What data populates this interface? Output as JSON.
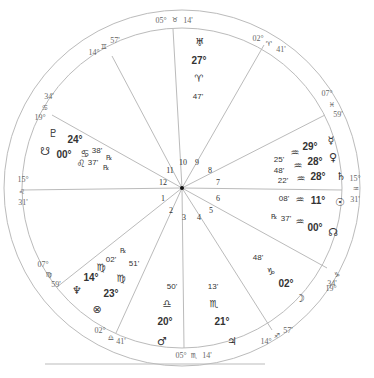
{
  "chart": {
    "center": [
      182,
      188
    ],
    "outer_radius": 178,
    "inner_radius": 160,
    "line_color": "#bbbbbb",
    "bottom_rule": {
      "x1": 45,
      "x2": 265,
      "y": 364
    }
  },
  "house_cusp_lines": [
    {
      "name": "cusp-line-10",
      "x": 173,
      "y": 29
    },
    {
      "name": "cusp-line-9",
      "x": 264,
      "y": 45
    },
    {
      "name": "cusp-line-8",
      "x": 325,
      "y": 115
    },
    {
      "name": "cusp-line-7",
      "x": 342,
      "y": 190
    },
    {
      "name": "cusp-line-6",
      "x": 327,
      "y": 268
    },
    {
      "name": "cusp-line-5",
      "x": 272,
      "y": 330
    },
    {
      "name": "cusp-line-4",
      "x": 184,
      "y": 348
    },
    {
      "name": "cusp-line-3",
      "x": 116,
      "y": 333
    },
    {
      "name": "cusp-line-2",
      "x": 57,
      "y": 287
    },
    {
      "name": "cusp-line-1",
      "x": 22,
      "y": 190
    },
    {
      "name": "cusp-line-12",
      "x": 52,
      "y": 115
    },
    {
      "name": "cusp-line-11",
      "x": 112,
      "y": 56
    }
  ],
  "house_cusps": [
    {
      "house": 10,
      "degree": "05°",
      "sign": "♉",
      "sign_name": "taurus",
      "minute": "14'"
    },
    {
      "house": 11,
      "degree": "14°",
      "sign": "♊",
      "sign_name": "gemini",
      "minute": "57'"
    },
    {
      "house": 12,
      "degree": "19°",
      "sign": "♋",
      "sign_name": "cancer",
      "minute": "34'"
    },
    {
      "house": 1,
      "degree": "15°",
      "sign": "♌",
      "sign_name": "leo",
      "minute": "31'"
    },
    {
      "house": 2,
      "degree": "07°",
      "sign": "♍",
      "sign_name": "virgo",
      "minute": "59'"
    },
    {
      "house": 3,
      "degree": "02°",
      "sign": "♎",
      "sign_name": "libra",
      "minute": "41'"
    },
    {
      "house": 4,
      "degree": "05°",
      "sign": "♏",
      "sign_name": "scorpio",
      "minute": "14'"
    },
    {
      "house": 5,
      "degree": "14°",
      "sign": "♐",
      "sign_name": "sagittarius",
      "minute": "57'"
    },
    {
      "house": 6,
      "degree": "19°",
      "sign": "♑",
      "sign_name": "capricorn",
      "minute": "34'"
    },
    {
      "house": 7,
      "degree": "15°",
      "sign": "♒",
      "sign_name": "aquarius",
      "minute": "31'"
    },
    {
      "house": 8,
      "degree": "07°",
      "sign": "♓",
      "sign_name": "pisces",
      "minute": "59'"
    },
    {
      "house": 9,
      "degree": "02°",
      "sign": "♈",
      "sign_name": "aries",
      "minute": "41'"
    }
  ],
  "house_numbers": [
    "1",
    "2",
    "3",
    "4",
    "5",
    "6",
    "7",
    "8",
    "9",
    "10",
    "11",
    "12"
  ],
  "planets": [
    {
      "name": "uranus",
      "glyph": "♅",
      "degree": "27°",
      "sign": "♈",
      "minute": "47'",
      "retrograde": ""
    },
    {
      "name": "pluto",
      "glyph": "♇",
      "degree": "24°",
      "sign": "♋",
      "minute": "38'",
      "retrograde": "℞"
    },
    {
      "name": "south-node",
      "glyph": "☋",
      "degree": "00°",
      "sign": "♌",
      "minute": "37'",
      "retrograde": "℞"
    },
    {
      "name": "mercury",
      "glyph": "☿",
      "degree": "29°",
      "sign": "♒",
      "minute": "25'",
      "retrograde": ""
    },
    {
      "name": "venus",
      "glyph": "♀",
      "degree": "28°",
      "sign": "♒",
      "minute": "48'",
      "retrograde": ""
    },
    {
      "name": "saturn",
      "glyph": "♄",
      "degree": "28°",
      "sign": "♒",
      "minute": "22'",
      "retrograde": ""
    },
    {
      "name": "sun",
      "glyph": "☉",
      "degree": "11°",
      "sign": "♒",
      "minute": "08'",
      "retrograde": ""
    },
    {
      "name": "north-node",
      "glyph": "☊",
      "degree": "00°",
      "sign": "♒",
      "minute": "37'",
      "retrograde": "℞"
    },
    {
      "name": "moon",
      "glyph": "☽",
      "degree": "02°",
      "sign": "♑",
      "minute": "48'",
      "retrograde": ""
    },
    {
      "name": "jupiter",
      "glyph": "♃",
      "degree": "21°",
      "sign": "♏",
      "minute": "13'",
      "retrograde": ""
    },
    {
      "name": "mars",
      "glyph": "♂",
      "degree": "20°",
      "sign": "♎",
      "minute": "50'",
      "retrograde": ""
    },
    {
      "name": "neptune",
      "glyph": "♆",
      "degree": "14°",
      "sign": "♍",
      "minute": "",
      "retrograde": ""
    },
    {
      "name": "chiron",
      "glyph": "⚷",
      "degree": "23°",
      "sign": "♍",
      "minute": "51'",
      "retrograde": ""
    },
    {
      "name": "part-of-fortune",
      "glyph": "⊗",
      "degree": "",
      "sign": "",
      "minute": "",
      "retrograde": ""
    },
    {
      "name": "mercury-virgo-r",
      "glyph": "",
      "degree": "",
      "sign": "♍",
      "minute": "02'",
      "retrograde": "℞"
    }
  ]
}
